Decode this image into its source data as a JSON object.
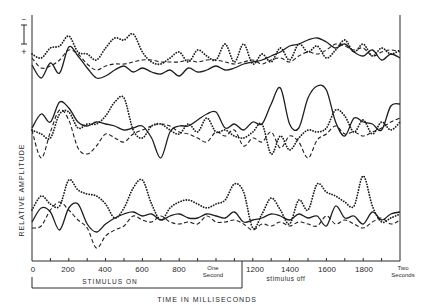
{
  "figure": {
    "y_axis_label": "RELATIVE AMPLITUDE",
    "x_axis_label": "TIME IN MILLISECONDS",
    "stimulus_on_label": "STIMULUS ON",
    "stimulus_off_label": "stimulus off",
    "one_second_label_line1": "One",
    "one_second_label_line2": "Second",
    "two_seconds_label_line1": "Two",
    "two_seconds_label_line2": "Seconds",
    "scale_bar_minus": "−",
    "scale_bar_plus": "+",
    "tick_labels": [
      "0",
      "200",
      "400",
      "600",
      "800",
      "1200",
      "1400",
      "1600",
      "1800"
    ],
    "colors": {
      "ink": "#1e1e1e",
      "background": "#ffffff"
    }
  },
  "chart_data": {
    "type": "line",
    "title": "",
    "xlabel": "TIME IN MILLISECONDS",
    "ylabel": "RELATIVE AMPLITUDE",
    "xlim": [
      0,
      2000
    ],
    "x_ticks_minor_step": 100,
    "x_tick_labels": [
      "0",
      "200",
      "400",
      "600",
      "800",
      "One Second",
      "1200",
      "1400",
      "1600",
      "1800",
      "Two Seconds"
    ],
    "annotations": [
      {
        "text": "STIMULUS ON",
        "x_range": [
          0,
          1140
        ]
      },
      {
        "text": "stimulus off",
        "x_range": [
          1140,
          2000
        ]
      },
      {
        "text": "scale bar (− up / + down)",
        "position": "top-left"
      }
    ],
    "grid": false,
    "legend": "none",
    "units": "relative amplitude (pixels above group baseline, arbitrary)",
    "x": [
      0,
      50,
      100,
      150,
      200,
      250,
      300,
      350,
      400,
      450,
      500,
      550,
      600,
      650,
      700,
      750,
      800,
      850,
      900,
      950,
      1000,
      1050,
      1100,
      1150,
      1200,
      1250,
      1300,
      1350,
      1400,
      1450,
      1500,
      1550,
      1600,
      1650,
      1700,
      1750,
      1800,
      1850,
      1900,
      1950,
      2000
    ],
    "groups": [
      {
        "name": "Group 1 (top)",
        "baseline_y": 58,
        "series": [
          {
            "name": "solid",
            "style": "solid",
            "values": [
              -7,
              -20,
              -5,
              -15,
              11,
              2,
              -10,
              -20,
              -18,
              -12,
              -8,
              -14,
              -10,
              -14,
              -16,
              -12,
              -18,
              -10,
              -14,
              -12,
              -8,
              -12,
              -10,
              -6,
              -4,
              -2,
              2,
              6,
              12,
              14,
              18,
              20,
              16,
              10,
              14,
              6,
              2,
              8,
              -2,
              4,
              0
            ]
          },
          {
            "name": "dashed",
            "style": "dashed",
            "values": [
              0,
              -10,
              -8,
              -2,
              8,
              4,
              -6,
              -12,
              -8,
              -6,
              -6,
              -4,
              -2,
              -2,
              -4,
              -4,
              -4,
              -2,
              -4,
              -2,
              -2,
              -4,
              -6,
              -4,
              -2,
              -6,
              -2,
              0,
              -4,
              2,
              6,
              4,
              8,
              14,
              12,
              8,
              10,
              2,
              6,
              8,
              6
            ]
          },
          {
            "name": "dotted",
            "style": "dotted",
            "values": [
              4,
              0,
              10,
              12,
              22,
              6,
              4,
              -2,
              10,
              20,
              18,
              24,
              6,
              -4,
              -6,
              0,
              6,
              -4,
              8,
              2,
              -2,
              14,
              -4,
              14,
              -6,
              4,
              -4,
              10,
              -2,
              14,
              6,
              12,
              0,
              8,
              18,
              6,
              14,
              2,
              10,
              4,
              8
            ]
          }
        ]
      },
      {
        "name": "Group 2 (middle)",
        "baseline_y": 128,
        "series": [
          {
            "name": "solid",
            "style": "solid",
            "values": [
              0,
              14,
              6,
              26,
              20,
              6,
              2,
              6,
              4,
              2,
              -2,
              0,
              2,
              -10,
              -30,
              -4,
              2,
              2,
              8,
              14,
              16,
              0,
              4,
              -2,
              6,
              4,
              24,
              40,
              4,
              0,
              30,
              42,
              38,
              6,
              -8,
              10,
              6,
              4,
              -2,
              22,
              24
            ]
          },
          {
            "name": "dashed",
            "style": "dashed",
            "values": [
              -2,
              -30,
              -4,
              18,
              8,
              -20,
              -26,
              -18,
              -6,
              -10,
              -14,
              -6,
              -2,
              2,
              4,
              2,
              -4,
              -6,
              -10,
              -14,
              -4,
              -8,
              -2,
              -18,
              -10,
              -14,
              -4,
              -20,
              -8,
              -14,
              -30,
              -12,
              -6,
              2,
              -6,
              -4,
              -8,
              -4,
              0,
              6,
              10
            ]
          },
          {
            "name": "dotted",
            "style": "dotted",
            "values": [
              -2,
              -6,
              -10,
              14,
              16,
              0,
              4,
              4,
              12,
              26,
              30,
              -2,
              -10,
              2,
              4,
              -2,
              -6,
              4,
              -4,
              10,
              -4,
              -2,
              -8,
              -10,
              -4,
              4,
              -26,
              -8,
              -22,
              -10,
              -2,
              -4,
              0,
              18,
              12,
              -4,
              8,
              -6,
              6,
              -2,
              6
            ]
          }
        ]
      },
      {
        "name": "Group 3 (bottom)",
        "baseline_y": 218,
        "series": [
          {
            "name": "solid",
            "style": "solid",
            "values": [
              -4,
              10,
              6,
              -12,
              10,
              14,
              -6,
              -14,
              -6,
              0,
              4,
              6,
              2,
              4,
              -2,
              2,
              4,
              0,
              0,
              4,
              2,
              0,
              6,
              -4,
              -2,
              0,
              4,
              2,
              -2,
              4,
              0,
              2,
              -8,
              12,
              0,
              2,
              -6,
              6,
              -2,
              4,
              6
            ]
          },
          {
            "name": "dashed",
            "style": "dashed",
            "values": [
              -10,
              -8,
              8,
              16,
              8,
              -2,
              -10,
              -30,
              -18,
              -12,
              -8,
              2,
              -2,
              -4,
              2,
              -4,
              -6,
              -4,
              -6,
              2,
              -4,
              -4,
              -2,
              -6,
              -12,
              -6,
              -8,
              -4,
              -8,
              -4,
              -6,
              -8,
              2,
              -6,
              -2,
              -6,
              -10,
              -4,
              0,
              -6,
              -2
            ]
          },
          {
            "name": "dotted",
            "style": "dotted",
            "values": [
              8,
              22,
              14,
              12,
              38,
              28,
              24,
              22,
              14,
              0,
              10,
              30,
              38,
              14,
              -2,
              10,
              16,
              18,
              14,
              10,
              14,
              18,
              34,
              26,
              -10,
              4,
              20,
              8,
              -6,
              18,
              8,
              34,
              26,
              22,
              16,
              12,
              42,
              12,
              -4,
              0,
              4
            ]
          }
        ]
      }
    ]
  }
}
